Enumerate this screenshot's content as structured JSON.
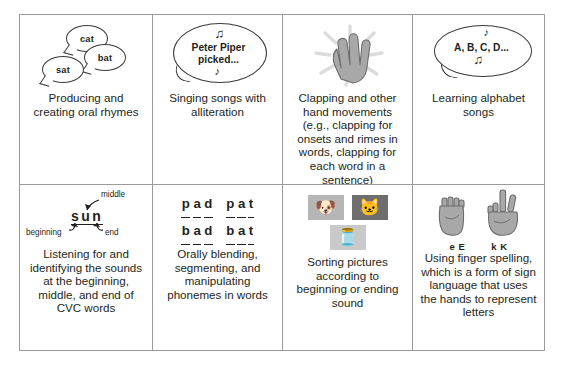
{
  "figure": {
    "rows": 2,
    "columns": 4,
    "border_color": "#9b9b9b",
    "text_color": "#231f20",
    "background": "#ffffff"
  },
  "cells": [
    {
      "id": "producing-creating-oral-rhymes",
      "caption": "Producing and creating oral rhymes",
      "art": "rhyme-speech-bubbles",
      "bubbles": [
        {
          "text": "cat"
        },
        {
          "text": "bat"
        },
        {
          "text": "sat"
        }
      ]
    },
    {
      "id": "singing-songs-alliteration",
      "caption": "Singing songs with alliteration",
      "art": "speech-bubble-with-music-notes",
      "bubble_line1": "Peter Piper",
      "bubble_line2": "picked...",
      "note_top": "♫",
      "note_bottom": "♪"
    },
    {
      "id": "clapping-hand-movements",
      "caption": "Clapping and other hand movements (e.g., clapping for onsets and rimes in words, clapping for each word in a sentence)",
      "art": "clapping-hand-with-sparkle"
    },
    {
      "id": "learning-alphabet-songs",
      "caption": "Learning alphabet songs",
      "art": "speech-bubble-with-music-notes",
      "bubble_text": "A, B, C, D...",
      "note_top": "♪",
      "note_bottom": "♫"
    },
    {
      "id": "listening-identifying-sounds-cvc",
      "caption": "Listening for and identifying the sounds at the beginning, middle, and end of CVC words",
      "art": "sun-word-with-position-labels",
      "word_letters": [
        "s",
        "u",
        "n"
      ],
      "label_middle": "middle",
      "label_beginning": "beginning",
      "label_end": "end"
    },
    {
      "id": "orally-blending-segmenting-manipulating",
      "caption": "Orally blending, segmenting, and manipulating phonemes in words",
      "art": "phoneme-word-grid",
      "word_rows": [
        [
          [
            "p",
            "a",
            "d"
          ],
          [
            "p",
            "a",
            "t"
          ]
        ],
        [
          [
            "b",
            "a",
            "d"
          ],
          [
            "b",
            "a",
            "t"
          ]
        ]
      ]
    },
    {
      "id": "sorting-pictures-by-sound",
      "caption": "Sorting pictures according to beginning or ending sound",
      "art": "picture-cards",
      "cards": [
        {
          "name": "dog-picture-card",
          "glyph": "🐶"
        },
        {
          "name": "cat-picture-card",
          "glyph": "🐱"
        },
        {
          "name": "jar-picture-card",
          "glyph": "🫙"
        }
      ]
    },
    {
      "id": "finger-spelling-sign-language",
      "caption": "Using finger spelling, which is a form of sign language that uses the hands to represent letters",
      "art": "finger-spelling-hands",
      "hand_labels": [
        "e E",
        "k K"
      ]
    }
  ]
}
